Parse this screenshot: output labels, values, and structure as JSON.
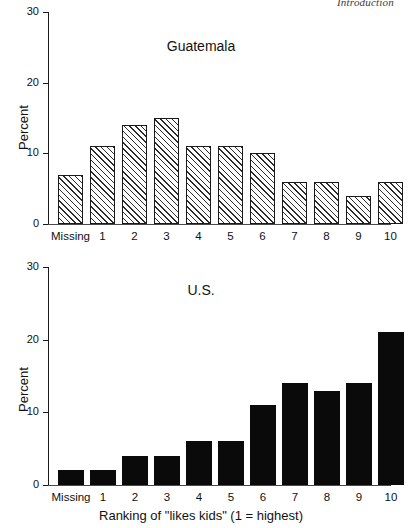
{
  "running_head": "Introduction",
  "axis": {
    "y_label": "Percent",
    "y_ticks": [
      "0",
      "10",
      "20",
      "30"
    ],
    "x_label": "Ranking of \"likes kids\" (1 = highest)",
    "x_categories": [
      "Missing",
      "1",
      "2",
      "3",
      "4",
      "5",
      "6",
      "7",
      "8",
      "9",
      "10"
    ]
  },
  "panels": [
    {
      "title": "Guatemala",
      "style": "hatched"
    },
    {
      "title": "U.S.",
      "style": "solid"
    }
  ],
  "chart_data": [
    {
      "type": "bar",
      "title": "Guatemala",
      "xlabel": "",
      "ylabel": "Percent",
      "ylim": [
        0,
        30
      ],
      "yticks": [
        0,
        10,
        20,
        30
      ],
      "grid": false,
      "legend": "none",
      "bar_style": "white with diagonal hatch, black outline",
      "categories": [
        "Missing",
        "1",
        "2",
        "3",
        "4",
        "5",
        "6",
        "7",
        "8",
        "9",
        "10"
      ],
      "values": [
        7,
        11,
        14,
        15,
        11,
        11,
        10,
        6,
        6,
        4,
        6
      ]
    },
    {
      "type": "bar",
      "title": "U.S.",
      "xlabel": "Ranking of \"likes kids\" (1 = highest)",
      "ylabel": "Percent",
      "ylim": [
        0,
        30
      ],
      "yticks": [
        0,
        10,
        20,
        30
      ],
      "grid": false,
      "legend": "none",
      "bar_style": "solid black fill",
      "categories": [
        "Missing",
        "1",
        "2",
        "3",
        "4",
        "5",
        "6",
        "7",
        "8",
        "9",
        "10"
      ],
      "values": [
        2,
        2,
        4,
        4,
        6,
        6,
        11,
        14,
        13,
        14,
        21
      ]
    }
  ]
}
